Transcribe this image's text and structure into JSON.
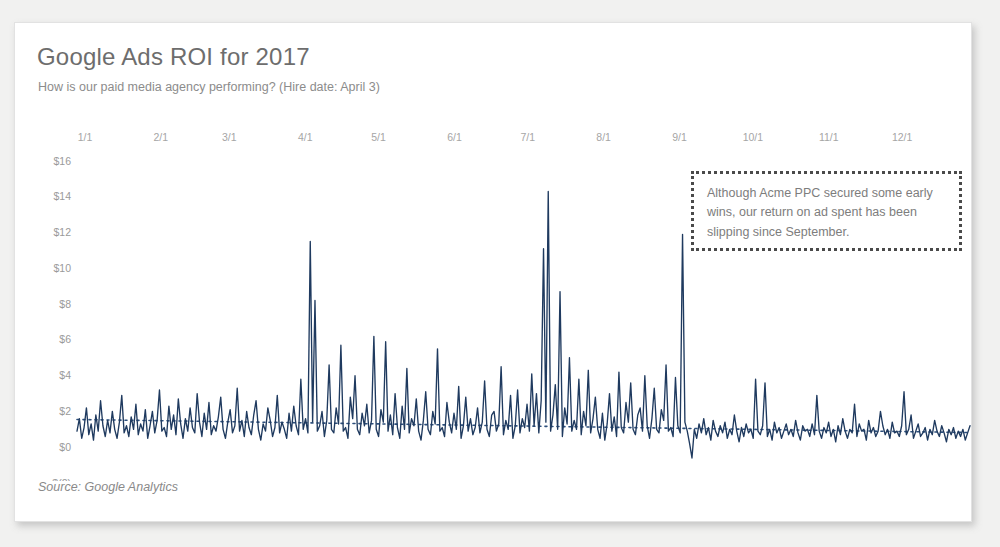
{
  "card": {
    "title": "Google Ads ROI for 2017",
    "subtitle": "How is our paid media agency performing? (Hire date: April 3)",
    "source": "Source: Google Analytics",
    "annotation": "Although Acme PPC secured some early wins, our return on ad spent has been slipping since September."
  },
  "colors": {
    "line": "#1f3a5f",
    "trend": "#2d4f7c",
    "title": "#6d6d6d",
    "subtitle": "#8c8c8c",
    "tick": "#9a9a9a",
    "card_bg": "#ffffff",
    "page_bg": "#f1f1f0",
    "annotation_border": "#4a4a4a"
  },
  "chart_data": {
    "type": "line",
    "title": "Google Ads ROI for 2017",
    "subtitle": "How is our paid media agency performing? (Hire date: April 3)",
    "xlabel": "",
    "ylabel": "",
    "ylim": [
      -2,
      16
    ],
    "grid": false,
    "legend": "none",
    "ytick_labels": [
      "$16",
      "$14",
      "$12",
      "$10",
      "$8",
      "$6",
      "$4",
      "$2",
      "$0",
      "$(2)"
    ],
    "ytick_values": [
      16,
      14,
      12,
      10,
      8,
      6,
      4,
      2,
      0,
      -2
    ],
    "xtick_labels": [
      "1/1",
      "2/1",
      "3/1",
      "4/1",
      "5/1",
      "6/1",
      "7/1",
      "8/1",
      "9/1",
      "10/1",
      "11/1",
      "12/1"
    ],
    "xtick_days": [
      0,
      31,
      59,
      90,
      120,
      151,
      181,
      212,
      243,
      273,
      304,
      334
    ],
    "series": [
      {
        "name": "Daily ROI",
        "style": "solid",
        "values": [
          0.9,
          1.6,
          0.5,
          1.1,
          2.2,
          0.7,
          1.3,
          0.4,
          1.8,
          0.9,
          2.6,
          1.2,
          0.6,
          1.5,
          0.8,
          2.0,
          1.0,
          0.5,
          1.4,
          2.9,
          0.8,
          1.2,
          0.6,
          1.7,
          1.0,
          2.4,
          0.7,
          1.3,
          0.9,
          2.1,
          0.5,
          1.2,
          2.0,
          0.8,
          1.5,
          3.2,
          0.9,
          1.1,
          0.6,
          2.3,
          1.0,
          1.8,
          0.7,
          2.7,
          1.3,
          0.5,
          1.6,
          0.9,
          2.2,
          1.1,
          0.8,
          3.0,
          1.4,
          0.6,
          1.9,
          1.0,
          2.5,
          0.7,
          1.2,
          0.9,
          1.7,
          2.8,
          1.0,
          0.5,
          1.4,
          2.1,
          0.8,
          1.2,
          3.3,
          0.9,
          1.5,
          0.6,
          2.0,
          1.1,
          0.7,
          1.8,
          2.6,
          1.0,
          0.4,
          1.3,
          0.9,
          2.2,
          1.5,
          0.6,
          1.1,
          2.9,
          0.8,
          1.4,
          1.0,
          0.5,
          1.9,
          0.9,
          2.3,
          1.2,
          0.7,
          3.8,
          1.0,
          1.6,
          0.8,
          11.5,
          1.4,
          8.2,
          0.9,
          1.2,
          2.0,
          0.6,
          1.5,
          4.6,
          1.0,
          0.8,
          2.2,
          1.3,
          5.7,
          0.9,
          1.1,
          0.5,
          2.8,
          1.6,
          4.0,
          1.0,
          0.7,
          1.9,
          1.2,
          2.4,
          0.8,
          1.5,
          6.2,
          1.0,
          0.6,
          2.1,
          1.4,
          5.9,
          0.9,
          1.8,
          0.7,
          3.0,
          1.1,
          0.5,
          2.3,
          1.0,
          4.4,
          0.8,
          1.6,
          1.2,
          2.7,
          0.9,
          0.4,
          1.5,
          3.1,
          1.0,
          0.7,
          2.0,
          1.3,
          5.5,
          0.9,
          1.1,
          0.6,
          2.5,
          1.4,
          0.8,
          1.9,
          1.0,
          3.4,
          0.5,
          1.2,
          2.8,
          0.9,
          1.6,
          0.7,
          1.1,
          2.2,
          0.8,
          1.4,
          3.7,
          1.0,
          0.6,
          1.8,
          2.0,
          0.9,
          1.3,
          4.5,
          0.7,
          1.5,
          1.0,
          2.9,
          0.5,
          1.2,
          3.2,
          0.8,
          1.6,
          1.1,
          2.4,
          0.9,
          4.1,
          1.2,
          3.0,
          0.8,
          2.6,
          11.1,
          1.4,
          14.3,
          0.9,
          1.8,
          3.5,
          1.0,
          8.7,
          0.6,
          2.2,
          1.3,
          5.0,
          0.9,
          1.5,
          1.0,
          3.8,
          0.7,
          2.0,
          1.2,
          4.3,
          0.8,
          1.6,
          2.8,
          1.0,
          0.5,
          1.9,
          0.4,
          1.3,
          3.0,
          0.9,
          1.7,
          0.6,
          4.2,
          1.1,
          0.8,
          2.5,
          1.4,
          3.6,
          1.0,
          0.7,
          1.8,
          2.2,
          0.9,
          4.0,
          1.2,
          0.5,
          1.6,
          3.3,
          1.0,
          0.8,
          2.1,
          1.5,
          4.6,
          0.9,
          1.1,
          0.6,
          3.9,
          1.2,
          0.8,
          11.9,
          1.4,
          0.9,
          0.2,
          -0.6,
          1.0,
          0.5,
          1.3,
          0.8,
          1.6,
          0.7,
          1.1,
          0.4,
          1.5,
          0.9,
          0.6,
          1.2,
          0.8,
          1.4,
          0.5,
          1.0,
          0.7,
          1.8,
          0.9,
          0.3,
          1.1,
          0.6,
          1.3,
          0.8,
          1.0,
          0.5,
          3.8,
          0.9,
          0.7,
          1.2,
          3.6,
          0.6,
          1.0,
          0.4,
          1.4,
          0.8,
          1.1,
          0.5,
          0.9,
          1.3,
          0.7,
          1.0,
          0.6,
          1.5,
          0.8,
          0.4,
          1.2,
          0.9,
          1.0,
          0.6,
          1.3,
          0.7,
          2.9,
          0.9,
          0.5,
          1.1,
          0.8,
          1.4,
          0.6,
          1.0,
          0.3,
          1.2,
          0.7,
          1.6,
          0.9,
          0.5,
          1.0,
          0.8,
          2.4,
          0.6,
          1.3,
          0.9,
          1.0,
          0.4,
          1.5,
          0.8,
          1.1,
          0.6,
          0.9,
          2.0,
          1.2,
          0.7,
          1.0,
          0.5,
          1.4,
          0.8,
          0.9,
          0.6,
          1.2,
          3.1,
          0.7,
          1.0,
          1.8,
          0.5,
          0.9,
          1.3,
          0.6,
          0.8,
          1.1,
          0.4,
          1.0,
          0.7,
          1.5,
          0.9,
          0.6,
          1.2,
          0.8,
          0.3,
          1.0,
          0.7,
          1.1,
          0.5,
          0.9,
          0.6,
          1.0,
          0.4,
          0.8,
          1.2
        ]
      },
      {
        "name": "Trend",
        "style": "dotted",
        "trend_start": 1.55,
        "trend_end": 0.82
      }
    ]
  }
}
